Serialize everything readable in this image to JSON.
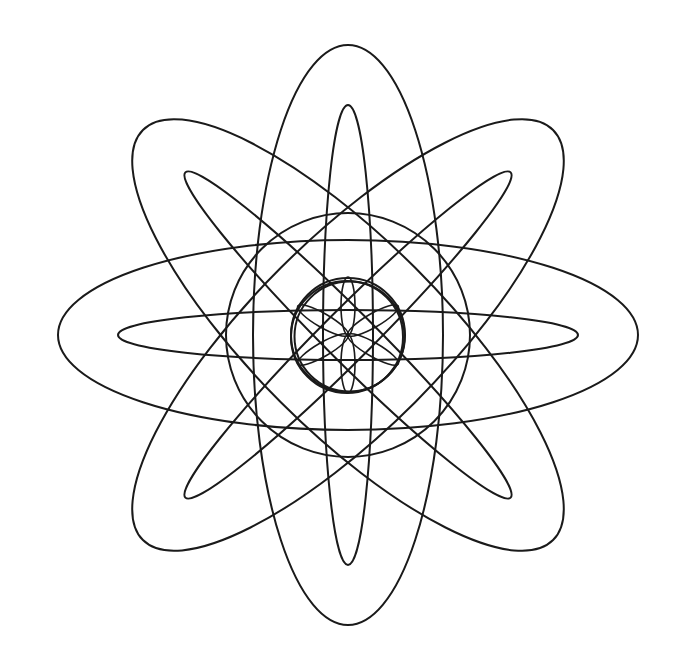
{
  "figure": {
    "background": "#ffffff",
    "stroke_color": "#1a1a1a",
    "center": [
      348,
      335
    ],
    "outer_ellipses": {
      "rx": 95,
      "ry": 290,
      "rotations_deg": [
        0,
        45,
        90,
        135
      ]
    },
    "inner_ellipses": {
      "rx": 25,
      "ry": 230,
      "rotations_deg": [
        0,
        45,
        90,
        135
      ]
    },
    "middle_circle": {
      "r": 122
    },
    "small_circles": [
      {
        "dx": 0,
        "dy": 0,
        "r": 57
      },
      {
        "dx": 1.5,
        "dy": 1.5,
        "r": 55
      },
      {
        "dx": -1,
        "dy": 2,
        "r": 56
      }
    ],
    "center_petals": {
      "rx": 7,
      "ry": 29,
      "offset": 29,
      "rotations_deg": [
        0,
        60,
        120,
        180,
        240,
        300
      ]
    }
  }
}
